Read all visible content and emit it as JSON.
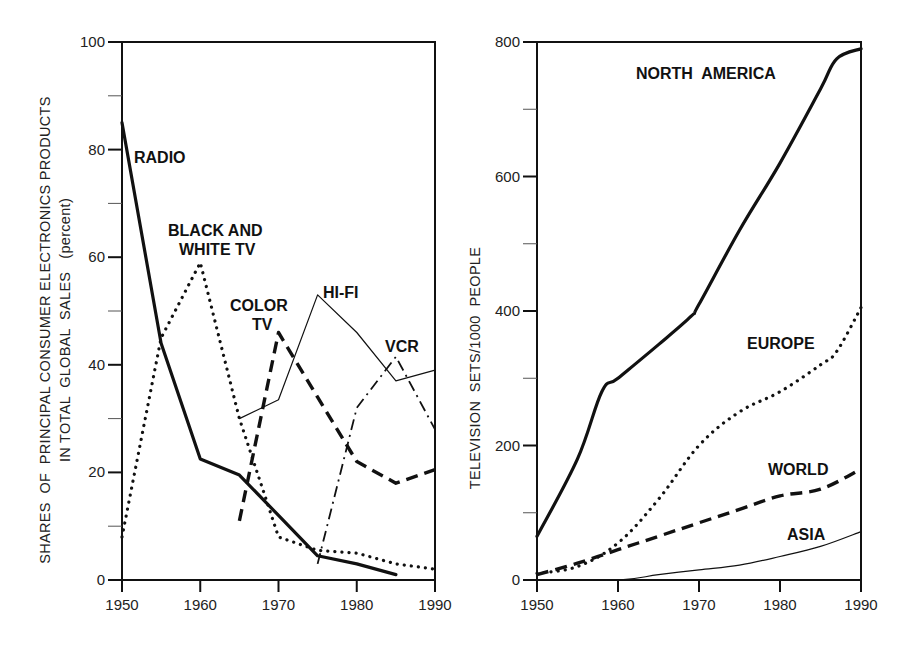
{
  "chart_data": [
    {
      "type": "line",
      "title": "",
      "xlabel": "",
      "ylabel": "SHARES OF PRINCIPAL CONSUMER ELECTRONICS PRODUCTS IN TOTAL GLOBAL SALES (percent)",
      "ylabel_lines": [
        "SHARES OF PRINCIPAL CONSUMER ELECTRONICS PRODUCTS",
        "IN TOTAL GLOBAL SALES (percent)"
      ],
      "xlim": [
        1950,
        1990
      ],
      "ylim": [
        0,
        100
      ],
      "x_ticks": [
        1950,
        1960,
        1970,
        1980,
        1990
      ],
      "x_minor_ticks": [
        1955,
        1965,
        1975,
        1985
      ],
      "y_ticks": [
        0,
        20,
        40,
        60,
        80,
        100
      ],
      "y_minor_ticks": [
        10,
        30,
        50,
        70,
        90
      ],
      "grid": false,
      "legend": "inline labels",
      "series": [
        {
          "name": "RADIO",
          "style": "solid-thick",
          "x": [
            1950,
            1955,
            1960,
            1965,
            1970,
            1975,
            1980,
            1985
          ],
          "values": [
            85,
            44,
            22.5,
            19.5,
            12,
            4.5,
            3,
            1
          ]
        },
        {
          "name": "BLACK AND WHITE TV",
          "style": "dotted",
          "x": [
            1950,
            1955,
            1960,
            1965,
            1970,
            1975,
            1980,
            1985,
            1990
          ],
          "values": [
            8,
            45,
            59,
            30,
            8,
            5.5,
            5,
            3,
            2
          ]
        },
        {
          "name": "COLOR TV",
          "style": "dashed-thick",
          "x": [
            1965,
            1970,
            1975,
            1980,
            1985,
            1990
          ],
          "values": [
            11,
            46,
            34,
            22,
            18,
            20.5
          ]
        },
        {
          "name": "HI-FI",
          "style": "solid-thin",
          "x": [
            1965,
            1970,
            1975,
            1980,
            1985,
            1990
          ],
          "values": [
            30,
            33.5,
            53,
            46,
            37,
            39
          ]
        },
        {
          "name": "VCR",
          "style": "dash-dot",
          "x": [
            1975,
            1980,
            1985,
            1990
          ],
          "values": [
            3,
            32,
            41.5,
            28
          ]
        }
      ]
    },
    {
      "type": "line",
      "title": "",
      "xlabel": "",
      "ylabel": "TELEVISION SETS/1000 PEOPLE",
      "xlim": [
        1950,
        1990
      ],
      "ylim": [
        0,
        800
      ],
      "x_ticks": [
        1950,
        1960,
        1970,
        1980,
        1990
      ],
      "y_ticks": [
        0,
        200,
        400,
        600,
        800
      ],
      "y_minor_ticks": [
        100,
        300,
        500,
        700
      ],
      "grid": false,
      "legend": "inline labels",
      "series": [
        {
          "name": "NORTH AMERICA",
          "style": "solid-thick",
          "x": [
            1950,
            1955,
            1958,
            1960,
            1965,
            1969,
            1970,
            1975,
            1980,
            1985,
            1987,
            1990
          ],
          "values": [
            65,
            180,
            280,
            300,
            350,
            392,
            410,
            520,
            620,
            730,
            775,
            790
          ]
        },
        {
          "name": "EUROPE",
          "style": "dotted",
          "x": [
            1950,
            1955,
            1960,
            1965,
            1970,
            1975,
            1980,
            1985,
            1987,
            1990
          ],
          "values": [
            10,
            20,
            55,
            120,
            200,
            250,
            280,
            320,
            340,
            405
          ]
        },
        {
          "name": "WORLD",
          "style": "dashed-thick",
          "x": [
            1950,
            1955,
            1960,
            1965,
            1970,
            1975,
            1980,
            1985,
            1990
          ],
          "values": [
            8,
            25,
            45,
            65,
            85,
            105,
            125,
            135,
            165
          ]
        },
        {
          "name": "ASIA",
          "style": "solid-thin",
          "x": [
            1950,
            1960,
            1965,
            1970,
            1975,
            1980,
            1985,
            1990
          ],
          "values": [
            0,
            0,
            8,
            15,
            22,
            35,
            50,
            72
          ]
        }
      ]
    }
  ],
  "left_chart": {
    "ylabel_line1": "SHARES  OF  PRINCIPAL CONSUMER ELECTRONICS PRODUCTS",
    "ylabel_line2": "IN TOTAL  GLOBAL  SALES   (percent)",
    "x_tick_labels": [
      "1950",
      "1960",
      "1970",
      "1980",
      "1990"
    ],
    "y_tick_labels": [
      "0",
      "20",
      "40",
      "60",
      "80",
      "100"
    ],
    "labels": {
      "radio": "RADIO",
      "bw_line1": "BLACK AND",
      "bw_line2": "WHITE TV",
      "color_line1": "COLOR",
      "color_line2": "TV",
      "hifi": "HI-FI",
      "vcr": "VCR"
    }
  },
  "right_chart": {
    "ylabel": "TELEVISION  SETS/1000  PEOPLE",
    "x_tick_labels": [
      "1950",
      "1960",
      "1970",
      "1980",
      "1990"
    ],
    "y_tick_labels": [
      "0",
      "200",
      "400",
      "600",
      "800"
    ],
    "labels": {
      "north_america": "NORTH  AMERICA",
      "europe": "EUROPE",
      "world": "WORLD",
      "asia": "ASIA"
    }
  }
}
